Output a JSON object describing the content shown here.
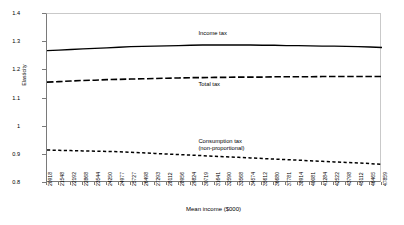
{
  "chart_data": {
    "type": "line",
    "title": "",
    "xlabel": "Mean income ($000)",
    "ylabel": "Elasticity",
    "ylim": [
      0.8,
      1.4
    ],
    "yticks": [
      "1.4",
      "1.3",
      "1.2",
      "1.1",
      "1",
      "0.9",
      "0.8"
    ],
    "ytick_values": [
      1.4,
      1.3,
      1.2,
      1.1,
      1.0,
      0.9,
      0.8
    ],
    "grid": false,
    "legend_position": "inline-annotations",
    "categories": [
      "20918",
      "21548",
      "22192",
      "22868",
      "23544",
      "24250",
      "24977",
      "25727",
      "26498",
      "27293",
      "28112",
      "28956",
      "29824",
      "30719",
      "31641",
      "32590",
      "33568",
      "34574",
      "35612",
      "36680",
      "37781",
      "38914",
      "40081",
      "41284",
      "42522",
      "43798",
      "45112",
      "46465",
      "47859"
    ],
    "series": [
      {
        "name": "Income tax",
        "style": "solid",
        "values": [
          1.27,
          1.272,
          1.274,
          1.276,
          1.278,
          1.28,
          1.282,
          1.284,
          1.285,
          1.286,
          1.287,
          1.288,
          1.289,
          1.29,
          1.29,
          1.29,
          1.29,
          1.29,
          1.289,
          1.289,
          1.288,
          1.288,
          1.287,
          1.286,
          1.286,
          1.285,
          1.284,
          1.283,
          1.281
        ]
      },
      {
        "name": "Total tax",
        "style": "long-dash",
        "values": [
          1.158,
          1.16,
          1.162,
          1.164,
          1.165,
          1.167,
          1.168,
          1.169,
          1.17,
          1.171,
          1.172,
          1.173,
          1.174,
          1.174,
          1.175,
          1.175,
          1.176,
          1.176,
          1.176,
          1.177,
          1.177,
          1.177,
          1.177,
          1.178,
          1.178,
          1.178,
          1.178,
          1.178,
          1.178
        ]
      },
      {
        "name": "Consumption tax (non-proportional)",
        "style": "short-dash",
        "values": [
          0.917,
          0.916,
          0.915,
          0.914,
          0.913,
          0.912,
          0.911,
          0.909,
          0.907,
          0.905,
          0.903,
          0.901,
          0.899,
          0.897,
          0.895,
          0.893,
          0.891,
          0.889,
          0.887,
          0.885,
          0.883,
          0.881,
          0.879,
          0.877,
          0.875,
          0.873,
          0.871,
          0.869,
          0.866
        ]
      }
    ],
    "annotations": [
      {
        "text": "Income tax",
        "x_frac": 0.455,
        "y_px": 30
      },
      {
        "text": "Total tax",
        "x_frac": 0.455,
        "y_px": 81
      },
      {
        "text": "Consumption tax",
        "x_frac": 0.455,
        "y_px": 138
      },
      {
        "text": "(non-proportional)",
        "x_frac": 0.455,
        "y_px": 145
      }
    ]
  }
}
